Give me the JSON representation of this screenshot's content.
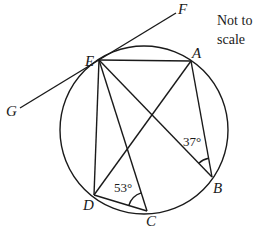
{
  "diagram": {
    "type": "circle-geometry",
    "note": [
      "Not to",
      "scale"
    ],
    "points": {
      "A": {
        "label": "A",
        "x": 191,
        "y": 61
      },
      "B": {
        "label": "B",
        "x": 212,
        "y": 177
      },
      "C": {
        "label": "C",
        "x": 147,
        "y": 211
      },
      "D": {
        "label": "D",
        "x": 94,
        "y": 195
      },
      "E": {
        "label": "E",
        "x": 99,
        "y": 60
      },
      "F": {
        "label": "F",
        "x": 176,
        "y": 13
      },
      "G": {
        "label": "G",
        "x": 20,
        "y": 108
      }
    },
    "circle": {
      "cx": 144,
      "cy": 130,
      "r": 84
    },
    "tangent": {
      "label": "GF",
      "through": "E"
    },
    "segments": [
      "EA",
      "AB",
      "AD",
      "EB",
      "EC",
      "ED",
      "DC"
    ],
    "angles": [
      {
        "vertex": "B",
        "between": [
          "E",
          "A"
        ],
        "value": "37°"
      },
      {
        "vertex": "C",
        "between": [
          "D",
          "E"
        ],
        "value": "53°"
      }
    ]
  }
}
